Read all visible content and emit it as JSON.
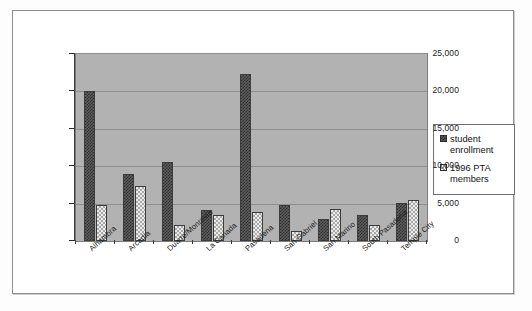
{
  "chart_data": {
    "type": "bar",
    "title": "",
    "xlabel": "",
    "ylabel": "",
    "ylim": [
      0,
      25000
    ],
    "yticks": [
      0,
      5000,
      10000,
      15000,
      20000,
      25000
    ],
    "ytick_labels": [
      "0",
      "5,000",
      "10,000",
      "15,000",
      "20,000",
      "25,000"
    ],
    "grid": true,
    "legend_position": "right",
    "categories": [
      "Alhambra",
      "Arcadia",
      "Duarte/Monrovia",
      "La Canada",
      "Pasadena",
      "San Gabriel",
      "San Marino",
      "South Pasadena",
      "Temple City"
    ],
    "series": [
      {
        "name": "student enrollment",
        "pattern": "dark-checker",
        "values": [
          20000,
          9000,
          10600,
          4100,
          22300,
          4800,
          2900,
          3500,
          5100
        ]
      },
      {
        "name": "1996 PTA members",
        "pattern": "light-dotted",
        "values": [
          4800,
          7400,
          2200,
          3500,
          3900,
          1400,
          4300,
          2200,
          5500
        ]
      }
    ]
  },
  "legend": {
    "entries": [
      {
        "label_line1": "student",
        "label_line2": "enrollment"
      },
      {
        "label_line1": "1996 PTA",
        "label_line2": "members"
      }
    ]
  },
  "colors": {
    "plot_background": "#b2b2b2",
    "series_1": "#3a3a3a",
    "series_2": "#ebebeb",
    "gridline": "#8e8e8e",
    "frame": "#8d8d8d"
  },
  "caption": ""
}
